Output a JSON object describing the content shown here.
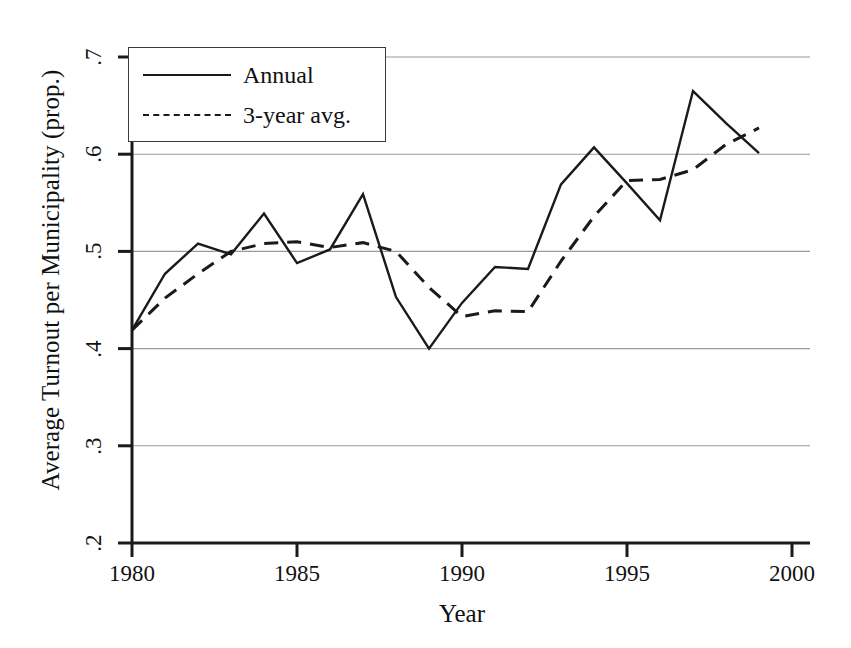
{
  "chart_data": {
    "type": "line",
    "title": "",
    "xlabel": "Year",
    "ylabel": "Average Turnout per Municipality (prop.)",
    "xlim": [
      1980,
      2000
    ],
    "ylim": [
      0.2,
      0.7
    ],
    "xticks": [
      "1980",
      "1985",
      "1990",
      "1995",
      "2000"
    ],
    "xtick_values": [
      1980,
      1985,
      1990,
      1995,
      2000
    ],
    "yticks": [
      ".2",
      ".3",
      ".4",
      ".5",
      ".6",
      ".7"
    ],
    "ytick_values": [
      0.2,
      0.3,
      0.4,
      0.5,
      0.6,
      0.7
    ],
    "grid": "horizontal",
    "legend_position": "top-left",
    "x": [
      1980,
      1981,
      1982,
      1983,
      1984,
      1985,
      1986,
      1987,
      1988,
      1989,
      1990,
      1991,
      1992,
      1993,
      1994,
      1995,
      1996,
      1997,
      1998,
      1999
    ],
    "series": [
      {
        "name": "Annual",
        "style": "solid",
        "color": "#1a1a1a",
        "values": [
          0.419,
          0.477,
          0.508,
          0.497,
          0.539,
          0.488,
          0.502,
          0.559,
          0.453,
          0.4,
          0.447,
          0.484,
          0.482,
          0.569,
          0.607,
          0.57,
          0.532,
          0.665,
          0.632,
          0.601
        ]
      },
      {
        "name": "3-year avg.",
        "style": "dashed",
        "color": "#1a1a1a",
        "values": [
          0.419,
          0.452,
          0.477,
          0.5,
          0.508,
          0.51,
          0.504,
          0.509,
          0.5,
          0.463,
          0.433,
          0.439,
          0.438,
          0.49,
          0.536,
          0.573,
          0.574,
          0.584,
          0.61,
          0.627
        ]
      }
    ]
  },
  "legend": {
    "items": [
      {
        "label": "Annual",
        "style": "solid"
      },
      {
        "label": "3-year avg.",
        "style": "dashed"
      }
    ]
  }
}
